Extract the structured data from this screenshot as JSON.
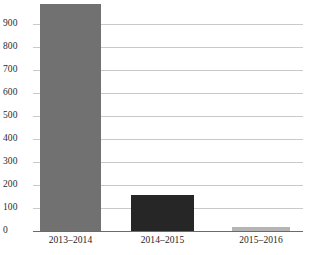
{
  "chart_data": {
    "type": "bar",
    "title": "",
    "subtitle": "",
    "xlabel": "",
    "ylabel": "",
    "categories": [
      "2013–2014",
      "2014–2015",
      "2015–2016"
    ],
    "values": [
      987,
      156,
      17
    ],
    "series": [
      {
        "name": "",
        "values": [
          987,
          156,
          17
        ],
        "colors": [
          "#717171",
          "#262626",
          "#b5b5b5"
        ]
      }
    ],
    "ylim": [
      0,
      1000
    ],
    "ytick_labels": [
      "0",
      "100",
      "200",
      "300",
      "400",
      "500",
      "600",
      "700",
      "800",
      "900"
    ],
    "ytick_values": [
      0,
      100,
      200,
      300,
      400,
      500,
      600,
      700,
      800,
      900
    ],
    "grid": true,
    "grid_axis": "y",
    "legend": false,
    "legend_position": "none",
    "annotations": [],
    "bar_colors": {
      "bar_2013_2014": "#717171",
      "bar_2014_2015": "#262626",
      "bar_2015_2016": "#b5b5b5"
    },
    "axis_color": "#6b6b6b",
    "gridline_color": "#c9c9c9",
    "background_color": "#ffffff",
    "text_color": "#1d1d1d"
  }
}
